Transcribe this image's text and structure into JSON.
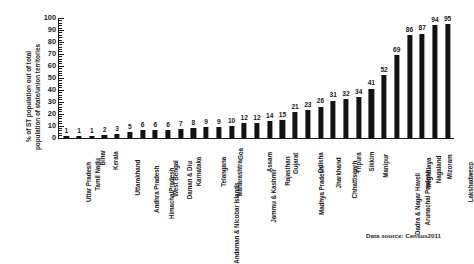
{
  "chart_data": {
    "type": "bar",
    "title": "",
    "xlabel": "",
    "ylabel_line1": "% of ST population out of total",
    "ylabel_line2": "population of state/union territories",
    "ylim": [
      0,
      100
    ],
    "ytick_labels": [
      "0",
      "10",
      "20",
      "30",
      "40",
      "50",
      "60",
      "70",
      "80",
      "90",
      "100"
    ],
    "ytick_values": [
      0,
      10,
      20,
      30,
      40,
      50,
      60,
      70,
      80,
      90,
      100
    ],
    "grid": false,
    "legend": "none",
    "bar_color": "#121212",
    "categories": [
      "Uttar Pradesh",
      "Tamil Nadu",
      "Bihar",
      "Kerala",
      "Uttarakhand",
      "Andhra Pradesh",
      "HimachalPradesh",
      "West Bengal",
      "Daman & Diu",
      "Karnataka",
      "Andaman & Nicobar Islands",
      "Telangana",
      "Maharashtra",
      "Goa",
      "Jammu & Kashmir",
      "Assam",
      "Rajasthan",
      "Gujarat",
      "Madhya Pradesh",
      "Odisha",
      "Jharkhand",
      "Chhattisgarh",
      "Tripura",
      "Sikkim",
      "Manipur",
      "Dadra & Nagar Haveli",
      "Arunachal Pradesh",
      "Meghalaya",
      "Nagaland",
      "Mizoram",
      "Lakshadweep"
    ],
    "values": [
      1,
      1,
      1,
      2,
      3,
      5,
      6,
      6,
      6,
      7,
      8,
      9,
      9,
      10,
      12,
      12,
      14,
      15,
      21,
      23,
      26,
      31,
      32,
      34,
      41,
      52,
      69,
      86,
      87,
      94,
      95
    ]
  },
  "footer": {
    "source": "Data source: Census2011"
  }
}
